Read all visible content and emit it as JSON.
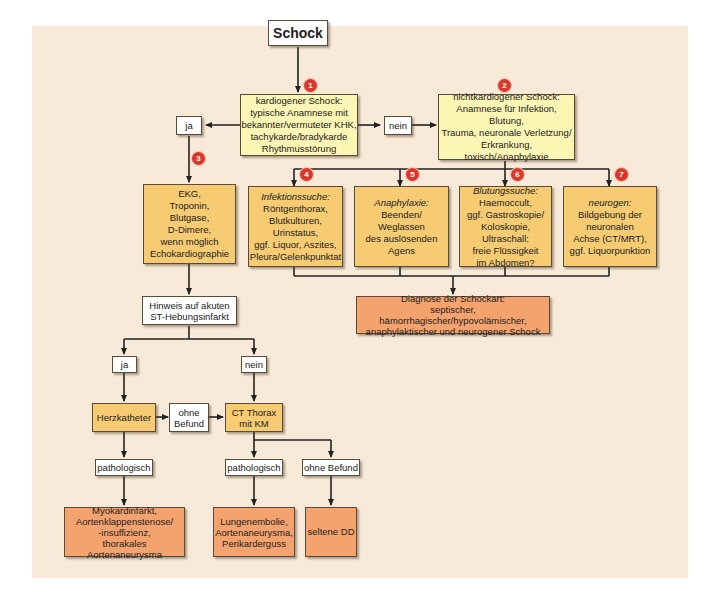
{
  "diagram": {
    "start": "Schock",
    "cardiogenic": {
      "badge": "1",
      "lines": [
        "kardiogener Schock:",
        "typische Anamnese mit",
        "bekannter/vermuteter KHK,",
        "tachykarde/bradykarde",
        "Rhythmusstörung"
      ]
    },
    "noncardiogenic": {
      "badge": "2",
      "lines": [
        "nichtkardiogener Schock:",
        "Anamnese für Infektion, Blutung,",
        "Trauma, neuronale Verletzung/",
        "Erkrankung, toxisch/Anaphylaxie"
      ]
    },
    "yes_label": "ja",
    "no_label": "nein",
    "diagnostics": {
      "badge": "3",
      "lines": [
        "EKG,",
        "Troponin,",
        "Blutgase,",
        "D-Dimere,",
        "wenn möglich",
        "Echokardiographie"
      ]
    },
    "infection": {
      "badge": "4",
      "heading": "Infektionssuche:",
      "lines": [
        "Röntgenthorax,",
        "Blutkulturen,",
        "Urinstatus,",
        "ggf. Liquor, Aszites,",
        "Pleura/Gelenkpunktat"
      ]
    },
    "anaphylaxis": {
      "badge": "5",
      "heading": "Anaphylaxie:",
      "lines": [
        "Beenden/",
        "Weglassen",
        "des auslösenden",
        "Agens"
      ]
    },
    "bleeding": {
      "badge": "6",
      "heading": "Blutungssuche:",
      "lines": [
        "Haemoccult,",
        "ggf. Gastroskopie/",
        "Koloskopie,",
        "Ultraschall:",
        "freie Flüssigkeit",
        "im Abdomen?"
      ]
    },
    "neurogenic": {
      "badge": "7",
      "heading": "neurogen:",
      "lines": [
        "Bildgebung der",
        "neuronalen",
        "Achse (CT/MRT),",
        "ggf. Liquorpunktion"
      ]
    },
    "shock_type": {
      "lines": [
        "Diagnose der Schockart:",
        "septischer, hämorrhagischer/hypovolämischer,",
        "anaphylaktischer und neurogener Schock"
      ]
    },
    "stemi_question": {
      "lines": [
        "Hinweis auf akuten",
        "ST-Hebungsinfarkt"
      ]
    },
    "stemi_yes": "ja",
    "stemi_no": "nein",
    "cath": "Herzkatheter",
    "cath_no_finding": {
      "lines": [
        "ohne",
        "Befund"
      ]
    },
    "ct": {
      "lines": [
        "CT Thorax",
        "mit KM"
      ]
    },
    "cath_pathologic": "pathologisch",
    "ct_pathologic": "pathologisch",
    "ct_no_finding": "ohne Befund",
    "result_cath": {
      "lines": [
        "Myokardinfarkt,",
        "Aortenklappenstenose/",
        "-insuffizienz,",
        "thorakales Aortenaneurysma"
      ]
    },
    "result_ct": {
      "lines": [
        "Lungenembolie,",
        "Aortenaneurysma,",
        "Perikarderguss"
      ]
    },
    "result_rare": "seltene DD"
  },
  "colors": {
    "background": "#f8ead8",
    "yellow_box": "#fbf6b4",
    "gold_box": "#f6cb72",
    "orange_box": "#f4a26e",
    "badge": "#d9392b"
  }
}
